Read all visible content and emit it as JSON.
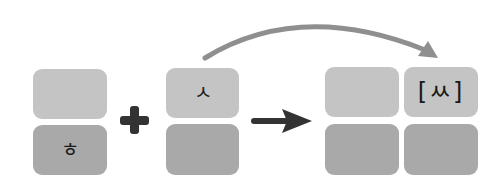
{
  "diagram": {
    "left_group": {
      "top": "",
      "bottom": "ㅎ"
    },
    "operator": "+",
    "middle_group": {
      "top": "ㅅ",
      "bottom": ""
    },
    "result_arrow": "right-arrow",
    "result_group": {
      "top_left": "",
      "top_right": "[ㅆ]",
      "bottom_left": "",
      "bottom_right": ""
    },
    "curved_arrow": "from ㅅ to [ㅆ]",
    "colors": {
      "light_box": "#c4c4c4",
      "dark_box": "#a9a9a9",
      "operator": "#333333",
      "curve": "#8f8f8f"
    }
  }
}
